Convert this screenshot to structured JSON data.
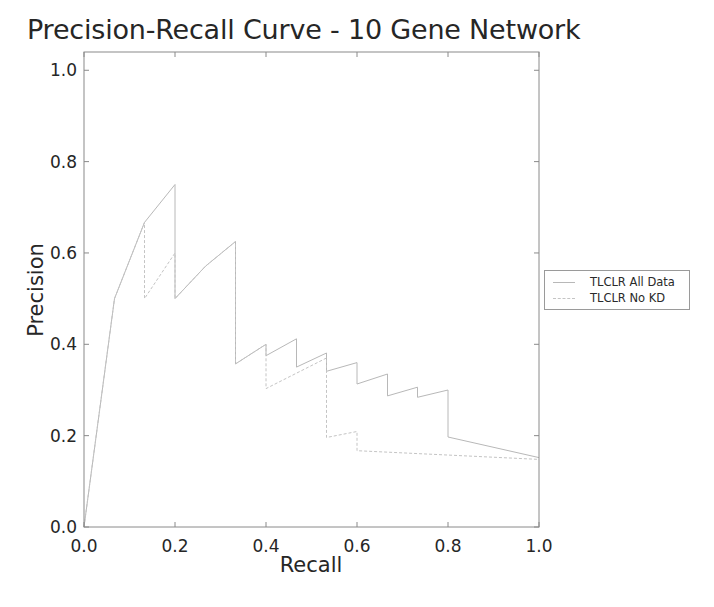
{
  "chart_data": {
    "type": "line",
    "title": "Precision-Recall Curve - 10 Gene Network",
    "xlabel": "Recall",
    "ylabel": "Precision",
    "xlim": [
      0.0,
      1.0
    ],
    "ylim": [
      0.0,
      1.04
    ],
    "x_ticks": [
      0.0,
      0.2,
      0.4,
      0.6,
      0.8,
      1.0
    ],
    "x_tick_labels": [
      "0.0",
      "0.2",
      "0.4",
      "0.6",
      "0.8",
      "1.0"
    ],
    "y_ticks": [
      0.0,
      0.2,
      0.4,
      0.6,
      0.8,
      1.0
    ],
    "y_tick_labels": [
      "0.0",
      "0.2",
      "0.4",
      "0.6",
      "0.8",
      "1.0"
    ],
    "grid": false,
    "legend_position": "right, outside plot",
    "series": [
      {
        "name": "TLCLR All Data",
        "color": "#b8b8b8",
        "dash": "",
        "points": [
          [
            0.0,
            0.0
          ],
          [
            0.067,
            0.5
          ],
          [
            0.133,
            0.667
          ],
          [
            0.2,
            0.75
          ],
          [
            0.2,
            0.5
          ],
          [
            0.267,
            0.571
          ],
          [
            0.333,
            0.625
          ],
          [
            0.333,
            0.357
          ],
          [
            0.4,
            0.4
          ],
          [
            0.4,
            0.375
          ],
          [
            0.467,
            0.412
          ],
          [
            0.467,
            0.35
          ],
          [
            0.533,
            0.381
          ],
          [
            0.533,
            0.341
          ],
          [
            0.6,
            0.36
          ],
          [
            0.6,
            0.313
          ],
          [
            0.667,
            0.335
          ],
          [
            0.667,
            0.287
          ],
          [
            0.733,
            0.306
          ],
          [
            0.733,
            0.284
          ],
          [
            0.8,
            0.3
          ],
          [
            0.8,
            0.197
          ],
          [
            1.0,
            0.152
          ]
        ]
      },
      {
        "name": "TLCLR No KD",
        "color": "#c4c4c4",
        "dash": "3,2",
        "points": [
          [
            0.0,
            0.0
          ],
          [
            0.067,
            0.5
          ],
          [
            0.133,
            0.667
          ],
          [
            0.133,
            0.5
          ],
          [
            0.2,
            0.6
          ],
          [
            0.2,
            0.5
          ],
          [
            0.267,
            0.571
          ],
          [
            0.333,
            0.625
          ],
          [
            0.333,
            0.357
          ],
          [
            0.4,
            0.4
          ],
          [
            0.4,
            0.303
          ],
          [
            0.533,
            0.37
          ],
          [
            0.533,
            0.196
          ],
          [
            0.6,
            0.209
          ],
          [
            0.6,
            0.167
          ],
          [
            1.0,
            0.148
          ]
        ]
      }
    ]
  },
  "legend": {
    "items": [
      {
        "label": "TLCLR All Data",
        "color": "#b8b8b8"
      },
      {
        "label": "TLCLR No KD",
        "color": "#c4c4c4"
      }
    ]
  }
}
